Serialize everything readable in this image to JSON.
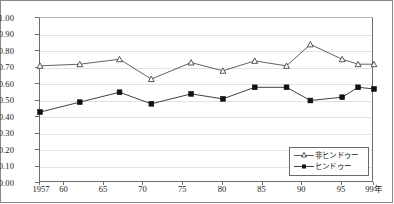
{
  "chart_data": {
    "type": "line",
    "title": "",
    "xlabel": "",
    "ylabel": "",
    "ylim": [
      0.0,
      1.0
    ],
    "ytick_step": 0.1,
    "yticks": [
      "0.00",
      "0.10",
      "0.20",
      "0.30",
      "0.40",
      "0.50",
      "0.60",
      "0.70",
      "0.80",
      "0.90",
      "1.00"
    ],
    "xticks": [
      "1957",
      "60",
      "65",
      "70",
      "75",
      "80",
      "85",
      "90",
      "95",
      "99年"
    ],
    "xtick_years": [
      1957,
      1960,
      1965,
      1970,
      1975,
      1980,
      1985,
      1990,
      1995,
      1999
    ],
    "xlim": [
      1957,
      1999
    ],
    "grid": "horizontal",
    "legend_position": "bottom-right",
    "x": [
      1957,
      1962,
      1967,
      1971,
      1976,
      1980,
      1984,
      1988,
      1991,
      1995,
      1997,
      1999
    ],
    "series": [
      {
        "name": "非ヒンドゥー",
        "marker": "open-triangle",
        "values": [
          0.71,
          0.72,
          0.75,
          0.63,
          0.73,
          0.68,
          0.74,
          0.71,
          0.84,
          0.75,
          0.72,
          0.72
        ]
      },
      {
        "name": "ヒンドゥー",
        "marker": "filled-square",
        "values": [
          0.43,
          0.49,
          0.55,
          0.48,
          0.54,
          0.51,
          0.58,
          0.58,
          0.5,
          0.52,
          0.58,
          0.57
        ]
      }
    ]
  },
  "legend": {
    "items": [
      {
        "label": "非ヒンドゥー"
      },
      {
        "label": "ヒンドゥー"
      }
    ]
  },
  "colors": {
    "series_nonhindu": "#3a3a3a",
    "series_hindu": "#111111",
    "grid": "#e2e2e2",
    "axis": "#6e6e6e",
    "frame": "#8a8a8a",
    "background": "#ffffff"
  }
}
